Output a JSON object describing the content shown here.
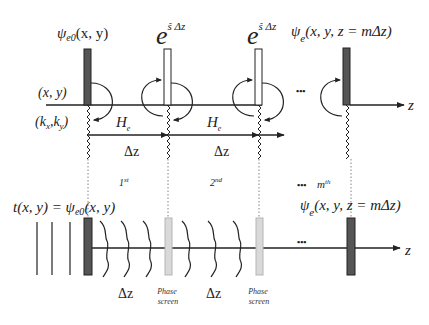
{
  "diagram": {
    "top": {
      "labels": {
        "psi_e0": "ψ",
        "psi_e0_sub": "e0",
        "psi_e0_args": "(x, y)",
        "exp_base_1": "e",
        "exp_sup_1": "ŝ Δz",
        "exp_base_2": "e",
        "exp_sup_2": "ŝ Δz",
        "psi_e_m": "ψ",
        "psi_e_m_sub": "e",
        "psi_e_m_args": "(x, y, z = mΔz)",
        "real_space": "(x, y)",
        "k_space_open": "(k",
        "k_space_x": "x",
        "k_space_mid": ",k",
        "k_space_y": "y",
        "k_space_close": ")",
        "He_1": "H",
        "He_1_sub": "e",
        "He_2": "H",
        "He_2_sub": "e",
        "dz_1": "Δz",
        "dz_2": "Δz",
        "ellipsis": "•••",
        "axis_z": "z"
      }
    },
    "bottom": {
      "labels": {
        "step_1": "1",
        "step_1_sup": "st",
        "step_2": "2",
        "step_2_sup": "nd",
        "step_m_ellipsis": "•••",
        "step_m": "m",
        "step_m_sup": "th",
        "transmission": "t(x, y) = ψ",
        "transmission_sub": "e0",
        "transmission_args": "(x, y)",
        "psi_e_m": "ψ",
        "psi_e_m_sub": "e",
        "psi_e_m_args": "(x, y, z = mΔz)",
        "dz_1": "Δz",
        "dz_2": "Δz",
        "phase_screen_1_line1": "Phase",
        "phase_screen_1_line2": "screen",
        "phase_screen_2_line1": "Phase",
        "phase_screen_2_line2": "screen",
        "ellipsis": "•••",
        "axis_z": "z"
      }
    },
    "colors": {
      "line": "#222222",
      "dark_bar": "#555555",
      "phase_screen": "#d9d9d9",
      "phase_screen_stroke": "#b5b5b5",
      "dotted": "#666666"
    }
  }
}
